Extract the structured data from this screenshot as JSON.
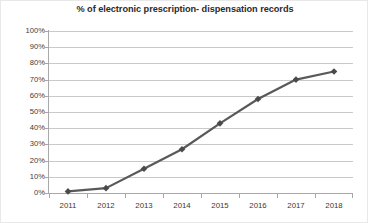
{
  "chart_data": {
    "type": "line",
    "title": "% of electronic prescription- dispensation records",
    "xlabel": "",
    "ylabel": "",
    "categories": [
      "2011",
      "2012",
      "2013",
      "2014",
      "2015",
      "2016",
      "2017",
      "2018"
    ],
    "values": [
      1,
      3,
      15,
      27,
      43,
      58,
      70,
      75
    ],
    "series": [
      {
        "name": "% of electronic prescription- dispensation records",
        "values": [
          1,
          3,
          15,
          27,
          43,
          58,
          70,
          75
        ]
      }
    ],
    "ylim": [
      0,
      100
    ],
    "y_ticks": [
      0,
      10,
      20,
      30,
      40,
      50,
      60,
      70,
      80,
      90,
      100
    ],
    "y_tick_labels": [
      "0%",
      "10%",
      "20%",
      "30%",
      "40%",
      "50%",
      "60%",
      "70%",
      "80%",
      "90%",
      "100%"
    ],
    "x_tick_labels": [
      "2011",
      "2012",
      "2013",
      "2014",
      "2015",
      "2016",
      "2017",
      "2018"
    ],
    "grid": "horizontal",
    "legend": "none",
    "marker": "diamond",
    "colors": {
      "line": "#595959",
      "marker": "#4a4a4a",
      "grid": "#c9c9c9",
      "axis": "#a8a8a8",
      "title_text": "#2b2b2b",
      "tick_text": "#3a3a3a",
      "background": "#ffffff"
    }
  }
}
